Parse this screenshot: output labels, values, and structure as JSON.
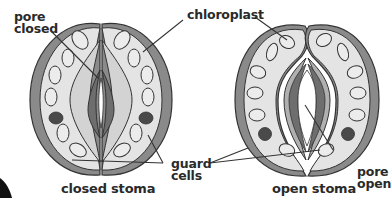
{
  "diagram": {
    "colors": {
      "outline": "#333333",
      "outer_wall": "#8a8a8a",
      "cell_fill": "#e4e4e4",
      "inner_wall": "#6e6e6e",
      "inner_band": "#b0b0b0",
      "nucleus": "#4a4a4a",
      "background": "#ffffff"
    },
    "labels": {
      "pore_closed_line1": "pore",
      "pore_closed_line2": "closed",
      "chloroplast": "chloroplast",
      "guard_cells_line1": "guard",
      "guard_cells_line2": "cells",
      "pore_open_line1": "pore",
      "pore_open_line2": "open"
    },
    "captions": {
      "closed": "closed stoma",
      "open": "open stoma"
    }
  }
}
